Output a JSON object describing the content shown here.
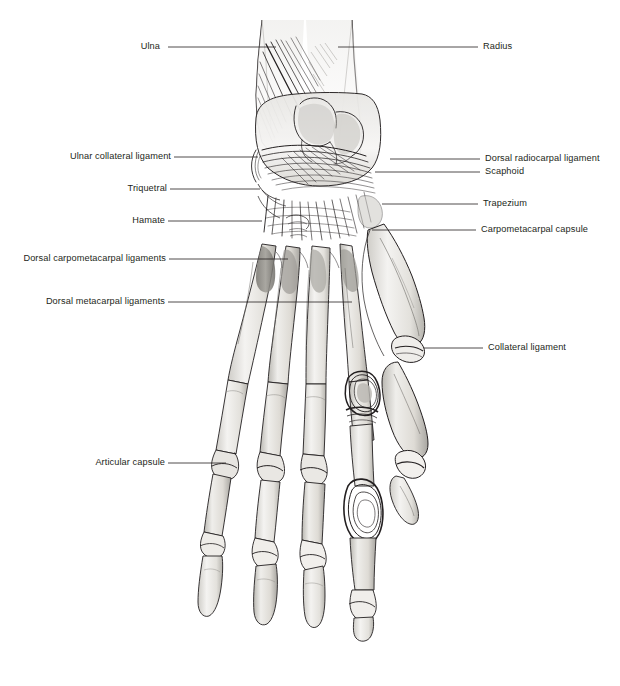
{
  "figure": {
    "background_color": "#ffffff",
    "ink_color": "#231f20",
    "shade_color": "#9b9a96",
    "width": 620,
    "height": 686
  },
  "labels": {
    "ulna": "Ulna",
    "radius": "Radius",
    "ulnar_collateral_ligament": "Ulnar collateral ligament",
    "dorsal_radiocarpal_ligament": "Dorsal radiocarpal ligament",
    "scaphoid": "Scaphoid",
    "triquetral": "Triquetral",
    "trapezium": "Trapezium",
    "hamate": "Hamate",
    "carpometacarpal_capsule": "Carpometacarpal capsule",
    "dorsal_carpometacarpal_ligaments": "Dorsal carpometacarpal ligaments",
    "dorsal_metacarpal_ligaments": "Dorsal metacarpal ligaments",
    "collateral_ligament": "Collateral ligament",
    "articular_capsule": "Articular capsule"
  }
}
